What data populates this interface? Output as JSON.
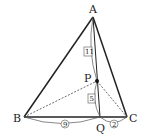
{
  "diagram": {
    "type": "triangle-geometry",
    "points": {
      "A": {
        "label": "A",
        "x": 93,
        "y": 17
      },
      "B": {
        "label": "B",
        "x": 24,
        "y": 117
      },
      "C": {
        "label": "C",
        "x": 127,
        "y": 117
      },
      "P": {
        "label": "P",
        "x": 97,
        "y": 81
      },
      "Q": {
        "label": "Q",
        "x": 100,
        "y": 117
      }
    },
    "segments_solid": [
      "AB",
      "AC",
      "BC",
      "AQ"
    ],
    "segments_dashed": [
      "BP",
      "PC"
    ],
    "ratios": {
      "AP": {
        "value": "11",
        "style": "boxed"
      },
      "PQ": {
        "value": "5",
        "style": "boxed"
      },
      "BQ": {
        "value": "9",
        "style": "circled"
      },
      "QC": {
        "value": "2",
        "style": "circled"
      }
    },
    "colors": {
      "line": "#222222",
      "dashed": "#444444",
      "arc": "#555555",
      "background": "#ffffff"
    }
  }
}
